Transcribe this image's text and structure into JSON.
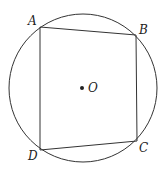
{
  "figure": {
    "circle": {
      "cx": 83,
      "cy": 88,
      "r": 74,
      "center_label": "O"
    },
    "points": [
      {
        "label": "A",
        "x": 40,
        "y": 27
      },
      {
        "label": "B",
        "x": 136,
        "y": 35
      },
      {
        "label": "C",
        "x": 137,
        "y": 141
      },
      {
        "label": "D",
        "x": 40,
        "y": 150
      }
    ],
    "segments": [
      "AB",
      "BC",
      "CD",
      "DA"
    ],
    "colors": {
      "stroke": "#333333",
      "background": "#ffffff"
    }
  }
}
